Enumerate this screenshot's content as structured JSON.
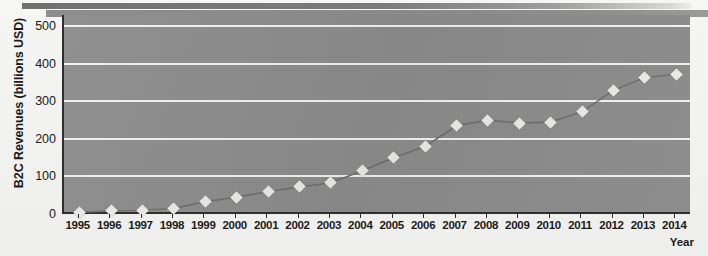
{
  "chart_data": {
    "type": "line",
    "title": "",
    "xlabel": "Year",
    "ylabel": "B2C Revenues (billions USD)",
    "categories": [
      "1995",
      "1996",
      "1997",
      "1998",
      "1999",
      "2000",
      "2001",
      "2002",
      "2003",
      "2004",
      "2005",
      "2006",
      "2007",
      "2008",
      "2009",
      "2010",
      "2011",
      "2012",
      "2013",
      "2014"
    ],
    "values": [
      5,
      8,
      10,
      15,
      33,
      45,
      60,
      72,
      83,
      115,
      150,
      180,
      235,
      250,
      242,
      245,
      272,
      330,
      363,
      372
    ],
    "series": [
      {
        "name": "B2C Revenues",
        "values": [
          5,
          8,
          10,
          15,
          33,
          45,
          60,
          72,
          83,
          115,
          150,
          180,
          235,
          250,
          242,
          245,
          272,
          330,
          363,
          372
        ]
      }
    ],
    "ylim": [
      0,
      530
    ],
    "yticks": [
      0,
      100,
      200,
      300,
      400,
      500
    ],
    "ytick_labels": [
      "0",
      "100",
      "200",
      "300",
      "400",
      "500"
    ],
    "grid": "horizontal",
    "legend": "none",
    "marker": "diamond",
    "colors": {
      "plot_background": "#8b8b8b",
      "gridline": "#f0f0ee",
      "axis": "#2e2e2e",
      "line": "#6e6e6e",
      "marker_fill": "#e8e8e6",
      "page_background": "#f3f3f1",
      "text": "#1b1b1b"
    }
  },
  "decor": {
    "top_rule_label": "top-rule",
    "top_rule_2_label": "top-rule-secondary"
  }
}
